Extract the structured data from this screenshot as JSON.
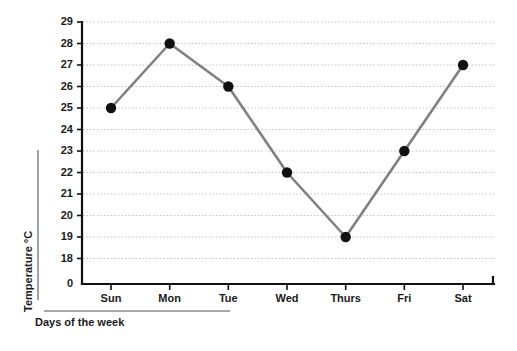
{
  "chart_data": {
    "type": "line",
    "title": "",
    "subtitle": "",
    "xlabel": "Days of the week",
    "ylabel": "Temperature  °C",
    "categories": [
      "Sun",
      "Mon",
      "Tue",
      "Wed",
      "Thurs",
      "Fri",
      "Sat"
    ],
    "values": [
      25,
      28,
      26,
      22,
      19,
      23,
      27
    ],
    "series": [
      {
        "name": "Temperature",
        "values": [
          25,
          28,
          26,
          22,
          19,
          23,
          27
        ]
      }
    ],
    "y_tick_labels": [
      "29",
      "28",
      "27",
      "26",
      "25",
      "24",
      "23",
      "22",
      "21",
      "20",
      "19",
      "18",
      "0"
    ],
    "y_tick_values": [
      29,
      28,
      27,
      26,
      25,
      24,
      23,
      22,
      21,
      20,
      19,
      18,
      0
    ],
    "x_tick_labels": [
      "Sun",
      "Mon",
      "Tue",
      "Wed",
      "Thurs",
      "Fri",
      "Sat"
    ],
    "ylim": [
      18,
      29
    ],
    "axis_break": true,
    "grid": "horizontal-dotted",
    "legend": "none",
    "annotations": [],
    "colors": {
      "line": "#808080",
      "marker": "#111111",
      "gridline": "#bdbdbd",
      "axis": "#111111",
      "label_rule": "#8a8a8a",
      "background": "#ffffff",
      "text": "#1a1a1a"
    },
    "units": "°C"
  },
  "axes": {
    "y_axis_title": "Temperature  °C",
    "x_axis_title": "Days of the week"
  }
}
